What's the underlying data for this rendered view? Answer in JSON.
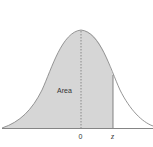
{
  "figure": {
    "type": "normal-distribution-diagram",
    "area_label": "Area",
    "x_tick_mean": "0",
    "x_tick_z": "z",
    "colors": {
      "shade": "#d6d6d6",
      "curve": "#8a8a8a",
      "axis": "#777777",
      "text": "#333333"
    }
  }
}
